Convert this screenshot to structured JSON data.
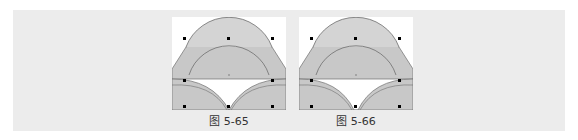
{
  "figures": [
    {
      "caption": "图 5-65",
      "variant": "a"
    },
    {
      "caption": "图 5-66",
      "variant": "b"
    }
  ],
  "colors": {
    "band": "#ececec",
    "shape_fill": "#c8c8c8",
    "outline": "#6e6e6e",
    "handle": "#000000"
  }
}
